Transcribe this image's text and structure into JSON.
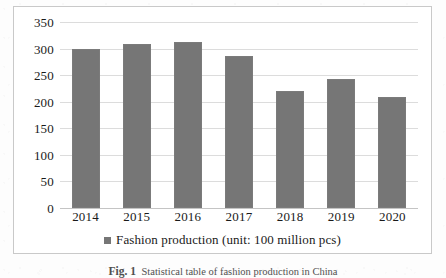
{
  "figure": {
    "caption_label": "Fig. 1",
    "caption_text": "Statistical table of fashion production in China"
  },
  "legend": {
    "swatch_name": "legend-color-swatch",
    "label": "Fashion production (unit: 100 million pcs)"
  },
  "chart_data": {
    "type": "bar",
    "title": "",
    "xlabel": "",
    "ylabel": "",
    "categories": [
      "2014",
      "2015",
      "2016",
      "2017",
      "2018",
      "2019",
      "2020"
    ],
    "values": [
      299,
      309,
      313,
      286,
      220,
      242,
      208
    ],
    "series": [
      {
        "name": "Fashion production (unit: 100 million pcs)",
        "color": "#767676",
        "values": [
          299,
          309,
          313,
          286,
          220,
          242,
          208
        ]
      }
    ],
    "ylim": [
      0,
      350
    ],
    "yticks": [
      0,
      50,
      100,
      150,
      200,
      250,
      300,
      350
    ],
    "ytick_labels": [
      "0",
      "50",
      "100",
      "150",
      "200",
      "250",
      "300",
      "350"
    ],
    "grid": true,
    "legend_position": "bottom"
  },
  "colors": {
    "bar": "#767676",
    "gridline": "#dcdcdc",
    "frame": "#c9c9c9",
    "text": "#1a1a1a"
  }
}
